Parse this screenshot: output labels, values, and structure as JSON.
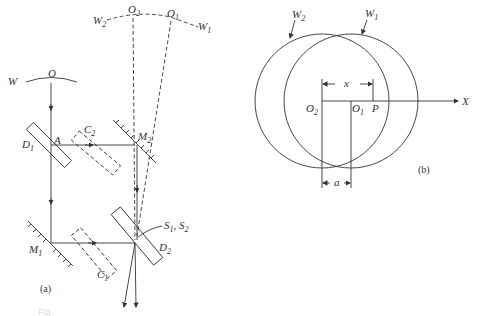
{
  "figure_a": {
    "panel_label": "(a)",
    "labels": {
      "W": "W",
      "O": "O",
      "W2": "W",
      "W2_sub": "2",
      "W1": "W",
      "W1_sub": "1",
      "O2": "O",
      "O2_sub": "2",
      "O1": "O",
      "O1_sub": "1",
      "D1": "D",
      "D1_sub": "1",
      "A": "A",
      "C2": "C",
      "C2_sub": "2",
      "M2": "M",
      "M2_sub": "2",
      "M1": "M",
      "M1_sub": "1",
      "C1": "C",
      "C1_sub": "1",
      "D2": "D",
      "D2_sub": "2",
      "S": "S",
      "S1_sub": "1",
      "S_sep": ", ",
      "S2": "S",
      "S2_sub": "2"
    }
  },
  "figure_b": {
    "panel_label": "(b)",
    "labels": {
      "W2": "W",
      "W2_sub": "2",
      "W1": "W",
      "W1_sub": "1",
      "x": "x",
      "O2": "O",
      "O2_sub": "2",
      "O1": "O",
      "O1_sub": "1",
      "P": "P",
      "X": "X",
      "a": "a"
    }
  },
  "caption": {
    "text": "Fig."
  }
}
